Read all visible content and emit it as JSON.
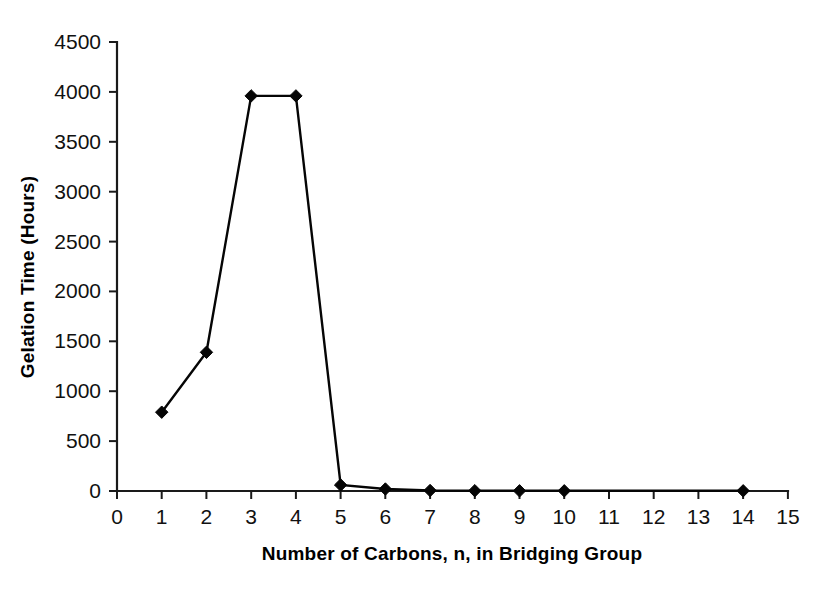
{
  "chart_data": {
    "type": "line",
    "title": "",
    "subtitle": "",
    "xlabel": "Number of Carbons, n, in Bridging Group",
    "ylabel": "Gelation Time (Hours)",
    "xlim": [
      0,
      15
    ],
    "ylim": [
      0,
      4500
    ],
    "xticks": [
      0,
      1,
      2,
      3,
      4,
      5,
      6,
      7,
      8,
      9,
      10,
      11,
      12,
      13,
      14,
      15
    ],
    "yticks": [
      0,
      500,
      1000,
      1500,
      2000,
      2500,
      3000,
      3500,
      4000,
      4500
    ],
    "xtick_labels": [
      "0",
      "1",
      "2",
      "3",
      "4",
      "5",
      "6",
      "7",
      "8",
      "9",
      "10",
      "11",
      "12",
      "13",
      "14",
      "15"
    ],
    "ytick_labels": [
      "0",
      "500",
      "1000",
      "1500",
      "2000",
      "2500",
      "3000",
      "3500",
      "4000",
      "4500"
    ],
    "grid": false,
    "legend": false,
    "legend_position": "none",
    "marker": "diamond",
    "marker_color": "#050505",
    "line_color": "#050505",
    "series": [
      {
        "name": "Gelation Time",
        "x": [
          1,
          2,
          3,
          4,
          5,
          6,
          7,
          8,
          9,
          10,
          14
        ],
        "values": [
          790,
          1390,
          3960,
          3960,
          60,
          20,
          5,
          3,
          2,
          2,
          2
        ]
      }
    ],
    "annotations": []
  },
  "figure": {
    "background_color": "#ffffff",
    "axis_color": "#1a1a1a"
  }
}
